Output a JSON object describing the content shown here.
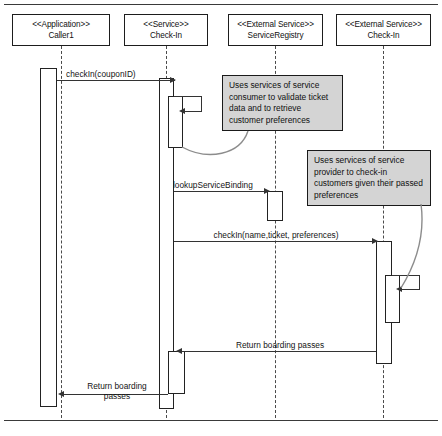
{
  "diagram": {
    "type": "uml-sequence-diagram"
  },
  "participants": [
    {
      "id": "caller1",
      "stereotype": "<<Application>>",
      "name": "Caller1"
    },
    {
      "id": "service-checkin",
      "stereotype": "<<Service>>",
      "name": "Check-In"
    },
    {
      "id": "service-registry",
      "stereotype": "<<External Service>>",
      "name": "ServiceRegistry"
    },
    {
      "id": "external-checkin",
      "stereotype": "<<External Service>>",
      "name": "Check-In"
    }
  ],
  "messages": [
    {
      "id": "m1",
      "label": "checkIn(couponID)",
      "from": "caller1",
      "to": "service-checkin",
      "kind": "call"
    },
    {
      "id": "m2",
      "label": "",
      "from": "service-checkin",
      "to": "service-checkin",
      "kind": "self-call"
    },
    {
      "id": "m3",
      "label": "lookupServiceBinding",
      "from": "service-checkin",
      "to": "service-registry",
      "kind": "call"
    },
    {
      "id": "m4",
      "label": "checkIn(name,ticket, preferences)",
      "from": "service-checkin",
      "to": "external-checkin",
      "kind": "call"
    },
    {
      "id": "m5",
      "label": "",
      "from": "external-checkin",
      "to": "external-checkin",
      "kind": "self-call"
    },
    {
      "id": "m6",
      "label": "Return boarding passes",
      "from": "external-checkin",
      "to": "service-checkin",
      "kind": "return"
    },
    {
      "id": "m7",
      "label": "Return boarding passes",
      "from": "service-checkin",
      "to": "caller1",
      "kind": "return"
    }
  ],
  "notes": [
    {
      "id": "note-consumer",
      "text": "Uses services of service consumer to validate ticket data and to retrieve customer preferences",
      "attached_to": "m2"
    },
    {
      "id": "note-provider",
      "text": "Uses services of service provider to check-in customers given their passed preferences",
      "attached_to": "m5"
    }
  ],
  "colors": {
    "note_fill": "#d4d4d4",
    "line": "#1d1d1d",
    "background": "#ffffff"
  }
}
